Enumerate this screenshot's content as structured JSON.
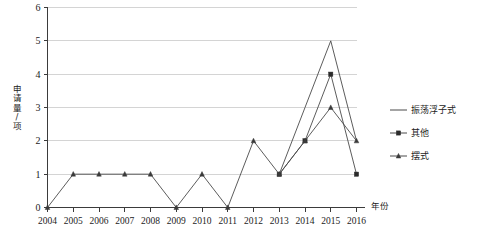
{
  "chart_data": {
    "type": "line",
    "title": "",
    "xlabel": "年份",
    "ylabel": "申请量/项",
    "x": [
      2004,
      2005,
      2006,
      2007,
      2008,
      2009,
      2010,
      2011,
      2012,
      2013,
      2014,
      2015,
      2016
    ],
    "categories": [
      "2004",
      "2005",
      "2006",
      "2007",
      "2008",
      "2009",
      "2010",
      "2011",
      "2012",
      "2013",
      "2014",
      "2015",
      "2016"
    ],
    "xlim": [
      2004,
      2016
    ],
    "ylim": [
      0,
      6
    ],
    "yticks": [
      "0",
      "1",
      "2",
      "3",
      "4",
      "5",
      "6"
    ],
    "grid": "horizontal",
    "legend_position": "right",
    "series": [
      {
        "name": "振荡浮子式",
        "marker": "none",
        "color": "#4a4a4a",
        "values": [
          null,
          null,
          null,
          null,
          null,
          null,
          null,
          null,
          null,
          1,
          3,
          5,
          2
        ]
      },
      {
        "name": "其他",
        "marker": "square",
        "color": "#2b2b2b",
        "values": [
          null,
          null,
          null,
          null,
          null,
          null,
          null,
          null,
          null,
          1,
          2,
          4,
          1
        ]
      },
      {
        "name": "摆式",
        "marker": "triangle",
        "color": "#3a3a3a",
        "values": [
          0,
          1,
          1,
          1,
          1,
          0,
          1,
          0,
          2,
          1,
          2,
          3,
          2
        ]
      }
    ]
  },
  "legend": {
    "items": [
      {
        "label": "振荡浮子式",
        "marker": "none"
      },
      {
        "label": "其他",
        "marker": "square"
      },
      {
        "label": "摆式",
        "marker": "triangle"
      }
    ]
  },
  "axes": {
    "x_title": "年份",
    "y_title": "申请量/项",
    "y_title_chars": [
      "申",
      "请",
      "量",
      "/",
      "项"
    ]
  },
  "colors": {
    "grid": "#c9c9c9",
    "axis": "#3b3b3b",
    "line": "#4a4a4a",
    "marker_square": "#2b2b2b",
    "marker_triangle": "#3a3a3a",
    "background": "#ffffff"
  }
}
